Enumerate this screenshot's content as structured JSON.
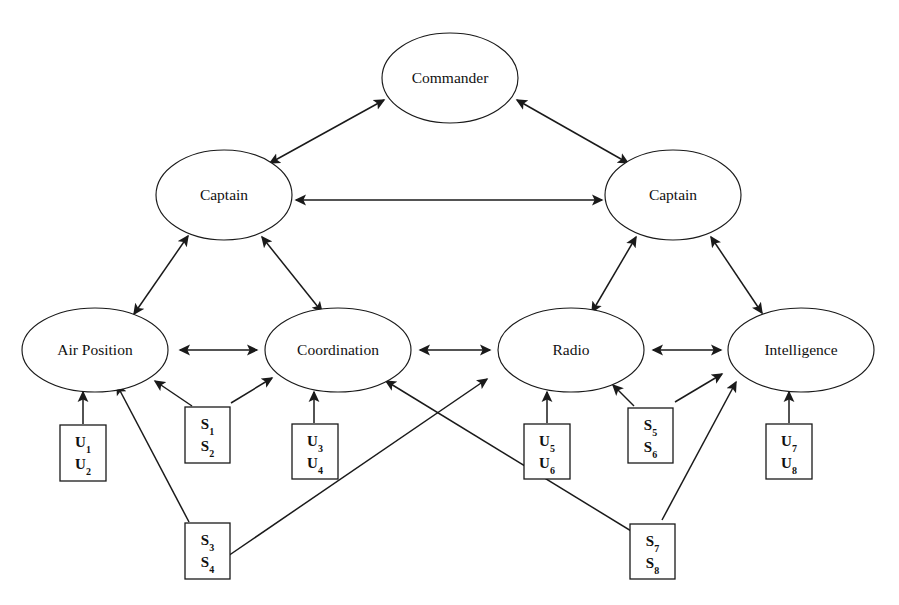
{
  "diagram": {
    "type": "node-link-diagram",
    "background_color": "#ffffff",
    "line_color": "#1a1a1a",
    "text_color": "#111111",
    "nodes": [
      {
        "id": "commander",
        "label": "Commander",
        "shape": "ellipse",
        "cx": 450,
        "cy": 78,
        "rx": 68,
        "ry": 45
      },
      {
        "id": "captain_left",
        "label": "Captain",
        "shape": "ellipse",
        "cx": 224,
        "cy": 195,
        "rx": 68,
        "ry": 45
      },
      {
        "id": "captain_right",
        "label": "Captain",
        "shape": "ellipse",
        "cx": 673,
        "cy": 195,
        "rx": 68,
        "ry": 45
      },
      {
        "id": "air_position",
        "label": "Air Position",
        "shape": "ellipse",
        "cx": 95,
        "cy": 350,
        "rx": 73,
        "ry": 42
      },
      {
        "id": "coordination",
        "label": "Coordination",
        "shape": "ellipse",
        "cx": 338,
        "cy": 350,
        "rx": 73,
        "ry": 42
      },
      {
        "id": "radio",
        "label": "Radio",
        "shape": "ellipse",
        "cx": 571,
        "cy": 350,
        "rx": 73,
        "ry": 42
      },
      {
        "id": "intelligence",
        "label": "Intelligence",
        "shape": "ellipse",
        "cx": 801,
        "cy": 350,
        "rx": 73,
        "ry": 42
      }
    ],
    "boxes": [
      {
        "id": "box_u1_u2",
        "lines": [
          "U1",
          "U2"
        ],
        "x": 60,
        "y": 425,
        "w": 46,
        "h": 56
      },
      {
        "id": "box_s1_s2",
        "lines": [
          "S1",
          "S2"
        ],
        "x": 185,
        "y": 407,
        "w": 45,
        "h": 56
      },
      {
        "id": "box_u3_u4",
        "lines": [
          "U3",
          "U4"
        ],
        "x": 292,
        "y": 424,
        "w": 46,
        "h": 55
      },
      {
        "id": "box_u5_u6",
        "lines": [
          "U5",
          "U6"
        ],
        "x": 524,
        "y": 424,
        "w": 46,
        "h": 55
      },
      {
        "id": "box_s5_s6",
        "lines": [
          "S5",
          "S6"
        ],
        "x": 628,
        "y": 408,
        "w": 45,
        "h": 55
      },
      {
        "id": "box_u7_u8",
        "lines": [
          "U7",
          "U8"
        ],
        "x": 766,
        "y": 424,
        "w": 46,
        "h": 55
      },
      {
        "id": "box_s3_s4",
        "lines": [
          "S3",
          "S4"
        ],
        "x": 185,
        "y": 523,
        "w": 45,
        "h": 56
      },
      {
        "id": "box_s7_s8",
        "lines": [
          "S7",
          "S8"
        ],
        "x": 630,
        "y": 524,
        "w": 45,
        "h": 55
      }
    ],
    "edges": [
      {
        "id": "e_captainL_commander",
        "from": "captain_left",
        "to": "commander",
        "arrow": "both",
        "x1": 270,
        "y1": 163,
        "x2": 384,
        "y2": 100
      },
      {
        "id": "e_commander_captainR",
        "from": "commander",
        "to": "captain_right",
        "arrow": "both",
        "x1": 517,
        "y1": 100,
        "x2": 628,
        "y2": 163
      },
      {
        "id": "e_captainL_captainR",
        "from": "captain_left",
        "to": "captain_right",
        "arrow": "both",
        "x1": 296,
        "y1": 200,
        "x2": 602,
        "y2": 200
      },
      {
        "id": "e_airpos_captainL",
        "from": "air_position",
        "to": "captain_left",
        "arrow": "both",
        "x1": 134,
        "y1": 314,
        "x2": 188,
        "y2": 236
      },
      {
        "id": "e_coord_captainL",
        "from": "coordination",
        "to": "captain_left",
        "arrow": "both",
        "x1": 322,
        "y1": 312,
        "x2": 262,
        "y2": 237
      },
      {
        "id": "e_radio_captainR",
        "from": "radio",
        "to": "captain_right",
        "arrow": "both",
        "x1": 592,
        "y1": 312,
        "x2": 636,
        "y2": 237
      },
      {
        "id": "e_intel_captainR",
        "from": "intelligence",
        "to": "captain_right",
        "arrow": "both",
        "x1": 762,
        "y1": 313,
        "x2": 711,
        "y2": 237
      },
      {
        "id": "e_airpos_coord",
        "from": "air_position",
        "to": "coordination",
        "arrow": "both",
        "x1": 180,
        "y1": 350,
        "x2": 257,
        "y2": 350
      },
      {
        "id": "e_coord_radio",
        "from": "coordination",
        "to": "radio",
        "arrow": "both",
        "x1": 420,
        "y1": 350,
        "x2": 490,
        "y2": 350
      },
      {
        "id": "e_radio_intel",
        "from": "radio",
        "to": "intelligence",
        "arrow": "both",
        "x1": 653,
        "y1": 350,
        "x2": 721,
        "y2": 350
      },
      {
        "id": "e_u1u2_airpos",
        "from": "box_u1_u2",
        "to": "air_position",
        "arrow": "end",
        "x1": 83,
        "y1": 424,
        "x2": 83,
        "y2": 392
      },
      {
        "id": "e_s1s2_airpos",
        "from": "box_s1_s2",
        "to": "air_position",
        "arrow": "end",
        "x1": 192,
        "y1": 406,
        "x2": 155,
        "y2": 381
      },
      {
        "id": "e_s1s2_coord",
        "from": "box_s1_s2",
        "to": "coordination",
        "arrow": "end",
        "x1": 231,
        "y1": 403,
        "x2": 272,
        "y2": 378
      },
      {
        "id": "e_u3u4_coord",
        "from": "box_u3_u4",
        "to": "coordination",
        "arrow": "end",
        "x1": 314,
        "y1": 423,
        "x2": 314,
        "y2": 392
      },
      {
        "id": "e_u5u6_radio",
        "from": "box_u5_u6",
        "to": "radio",
        "arrow": "end",
        "x1": 547,
        "y1": 423,
        "x2": 547,
        "y2": 392
      },
      {
        "id": "e_s5s6_radio",
        "from": "box_s5_s6",
        "to": "radio",
        "arrow": "end",
        "x1": 634,
        "y1": 406,
        "x2": 613,
        "y2": 385
      },
      {
        "id": "e_s5s6_intel",
        "from": "box_s5_s6",
        "to": "intelligence",
        "arrow": "end",
        "x1": 675,
        "y1": 402,
        "x2": 722,
        "y2": 374
      },
      {
        "id": "e_u7u8_intel",
        "from": "box_u7_u8",
        "to": "intelligence",
        "arrow": "end",
        "x1": 789,
        "y1": 423,
        "x2": 789,
        "y2": 392
      },
      {
        "id": "e_s3s4_airpos",
        "from": "box_s3_s4",
        "to": "air_position",
        "arrow": "end",
        "x1": 189,
        "y1": 522,
        "x2": 117,
        "y2": 385
      },
      {
        "id": "e_s3s4_radio",
        "from": "box_s3_s4",
        "to": "radio",
        "arrow": "end",
        "x1": 228,
        "y1": 556,
        "x2": 487,
        "y2": 379
      },
      {
        "id": "e_s7s8_coord",
        "from": "box_s7_s8",
        "to": "coordination",
        "arrow": "end",
        "x1": 672,
        "y1": 556,
        "x2": 386,
        "y2": 381
      },
      {
        "id": "e_s7s8_intel",
        "from": "box_s7_s8",
        "to": "intelligence",
        "arrow": "end",
        "x1": 662,
        "y1": 520,
        "x2": 736,
        "y2": 382
      }
    ]
  }
}
